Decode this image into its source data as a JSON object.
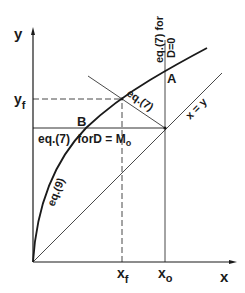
{
  "diagram": {
    "axes": {
      "x_label": "x",
      "y_label": "y"
    },
    "ticks": {
      "x_f": {
        "main": "x",
        "sub": "f"
      },
      "x_o": {
        "main": "x",
        "sub": "o"
      },
      "y_f": {
        "main": "y",
        "sub": "f"
      }
    },
    "points": {
      "A": "A",
      "B": "B"
    },
    "curves": {
      "eq9": "eq.(9)",
      "eq7": "eq.(7)",
      "xy": "x = y",
      "eq7_Mo_prefix": "eq.(7)",
      "eq7_Mo_suffix": "forD = M",
      "eq7_Mo_sub": "o",
      "eq7_D0_line1": "eq.(7) for",
      "eq7_D0_line2": "D=0"
    },
    "colors": {
      "ink": "#1a1a1a",
      "background": "#ffffff"
    }
  }
}
